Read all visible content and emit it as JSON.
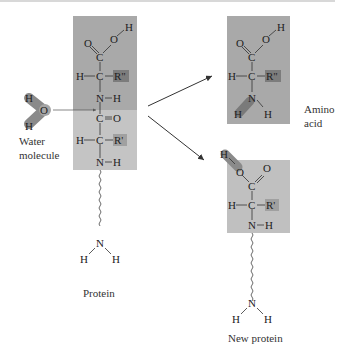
{
  "diagram": {
    "colors": {
      "box_dark": "#a8a8a8",
      "box_light": "#c2c2c2",
      "highlight": "#7a7a7a",
      "water_glow": "#8a8a8a",
      "line": "#333333"
    },
    "water": {
      "atoms": [
        "H",
        "O",
        "H"
      ],
      "label_line1": "Water",
      "label_line2": "molecule"
    },
    "protein": {
      "atoms_upper": [
        "O",
        "O",
        "H",
        "C",
        "H",
        "C",
        "R\"",
        "N",
        "H"
      ],
      "atoms_lower": [
        "C",
        "O",
        "H",
        "C",
        "R'",
        "N",
        "H"
      ],
      "terminal": [
        "N",
        "H",
        "H"
      ],
      "label": "Protein"
    },
    "amino_acid": {
      "atoms": [
        "O",
        "O",
        "H",
        "C",
        "H",
        "C",
        "R\"",
        "N",
        "H",
        "H"
      ],
      "label_line1": "Amino",
      "label_line2": "acid"
    },
    "new_protein": {
      "atoms": [
        "H",
        "O",
        "O",
        "C",
        "H",
        "C",
        "R'",
        "N",
        "H"
      ],
      "terminal": [
        "N",
        "H",
        "H"
      ],
      "label": "New protein"
    }
  }
}
